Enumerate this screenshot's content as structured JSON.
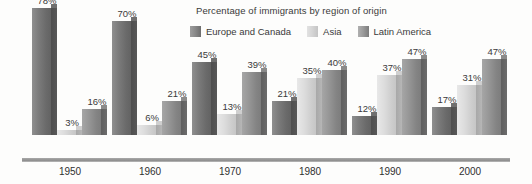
{
  "chart_data": {
    "type": "bar",
    "title": "Percentage of immigrants by region of origin",
    "xlabel": "",
    "ylabel": "",
    "ylim": [
      0,
      80
    ],
    "grid": false,
    "legend_position": "top",
    "value_suffix": "%",
    "categories": [
      "1950",
      "1960",
      "1970",
      "1980",
      "1990",
      "2000"
    ],
    "series": [
      {
        "name": "Europe and Canada",
        "color": "#7b7b7b",
        "values": [
          78,
          70,
          45,
          21,
          12,
          17
        ],
        "labels": [
          "78%",
          "70%",
          "45%",
          "21%",
          "12%",
          "17%"
        ]
      },
      {
        "name": "Asia",
        "color": "#dcdcdc",
        "values": [
          3,
          6,
          13,
          35,
          37,
          31
        ],
        "labels": [
          "3%",
          "6%",
          "13%",
          "35%",
          "37%",
          "31%"
        ]
      },
      {
        "name": "Latin America",
        "color": "#979797",
        "values": [
          16,
          21,
          39,
          40,
          47,
          47
        ],
        "labels": [
          "16%",
          "21%",
          "39%",
          "40%",
          "47%",
          "47%"
        ]
      }
    ]
  },
  "legend": {
    "items": [
      {
        "label": "Europe and Canada",
        "swatch": "legend-swatch-europe-and-canada"
      },
      {
        "label": "Asia",
        "swatch": "legend-swatch-asia"
      },
      {
        "label": "Latin America",
        "swatch": "legend-swatch-latin-america"
      }
    ]
  },
  "axis": {
    "tick_labels": [
      "1950",
      "1960",
      "1970",
      "1980",
      "1990",
      "2000"
    ]
  }
}
